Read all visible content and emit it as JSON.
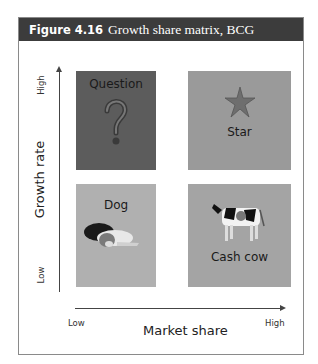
{
  "figure": {
    "number": "Figure 4.16",
    "caption": "Growth share matrix, BCG"
  },
  "axes": {
    "y_label": "Growth rate",
    "y_high": "High",
    "y_low": "Low",
    "x_label": "Market share",
    "x_low": "Low",
    "x_high": "High"
  },
  "quadrants": [
    {
      "label": "Question",
      "icon": "question-mark-icon",
      "color": "#5c5c5c"
    },
    {
      "label": "Star",
      "icon": "star-icon",
      "color": "#9a9a9a"
    },
    {
      "label": "Dog",
      "icon": "dog-icon",
      "color": "#b0b0b0"
    },
    {
      "label": "Cash cow",
      "icon": "cow-icon",
      "color": "#a4a4a4"
    }
  ]
}
